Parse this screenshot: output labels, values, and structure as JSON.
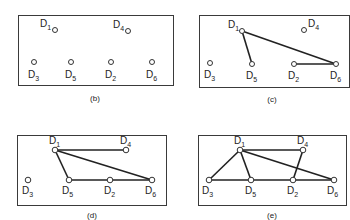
{
  "figure": {
    "panels": [
      {
        "id": "b",
        "caption": "(b)",
        "box": {
          "x": 18,
          "y": 15,
          "w": 155,
          "h": 70
        },
        "caption_pos": {
          "x": 95,
          "y": 101
        },
        "node_radius": 2.5,
        "nodes": [
          {
            "name": "D1",
            "base": "D",
            "sub": "1",
            "x": 55,
            "y": 30,
            "lx": 40,
            "ly": 27
          },
          {
            "name": "D4",
            "base": "D",
            "sub": "4",
            "x": 128,
            "y": 31,
            "lx": 113,
            "ly": 28
          },
          {
            "name": "D3",
            "base": "D",
            "sub": "3",
            "x": 34,
            "y": 62,
            "lx": 28,
            "ly": 78
          },
          {
            "name": "D5",
            "base": "D",
            "sub": "5",
            "x": 71,
            "y": 62,
            "lx": 65,
            "ly": 78
          },
          {
            "name": "D2",
            "base": "D",
            "sub": "2",
            "x": 111,
            "y": 62,
            "lx": 105,
            "ly": 78
          },
          {
            "name": "D6",
            "base": "D",
            "sub": "6",
            "x": 152,
            "y": 62,
            "lx": 146,
            "ly": 78
          }
        ],
        "edges": []
      },
      {
        "id": "c",
        "caption": "(c)",
        "box": {
          "x": 199,
          "y": 15,
          "w": 150,
          "h": 72
        },
        "caption_pos": {
          "x": 272,
          "y": 102
        },
        "node_radius": 2.5,
        "nodes": [
          {
            "name": "D1",
            "base": "D",
            "sub": "1",
            "x": 242,
            "y": 31,
            "lx": 228,
            "ly": 28
          },
          {
            "name": "D4",
            "base": "D",
            "sub": "4",
            "x": 304,
            "y": 30,
            "lx": 308,
            "ly": 27
          },
          {
            "name": "D3",
            "base": "D",
            "sub": "3",
            "x": 210,
            "y": 63,
            "lx": 204,
            "ly": 78
          },
          {
            "name": "D5",
            "base": "D",
            "sub": "5",
            "x": 252,
            "y": 64,
            "lx": 246,
            "ly": 79
          },
          {
            "name": "D2",
            "base": "D",
            "sub": "2",
            "x": 294,
            "y": 64,
            "lx": 288,
            "ly": 79
          },
          {
            "name": "D6",
            "base": "D",
            "sub": "6",
            "x": 336,
            "y": 64,
            "lx": 330,
            "ly": 79
          }
        ],
        "edges": [
          [
            "D1",
            "D5"
          ],
          [
            "D1",
            "D6"
          ],
          [
            "D2",
            "D6"
          ]
        ]
      },
      {
        "id": "d",
        "caption": "(d)",
        "box": {
          "x": 17,
          "y": 135,
          "w": 149,
          "h": 70
        },
        "caption_pos": {
          "x": 92,
          "y": 218
        },
        "node_radius": 2.8,
        "nodes": [
          {
            "name": "D1",
            "base": "D",
            "sub": "1",
            "x": 55,
            "y": 150,
            "lx": 49,
            "ly": 144
          },
          {
            "name": "D4",
            "base": "D",
            "sub": "4",
            "x": 126,
            "y": 150,
            "lx": 120,
            "ly": 144
          },
          {
            "name": "D3",
            "base": "D",
            "sub": "3",
            "x": 28,
            "y": 180,
            "lx": 22,
            "ly": 194
          },
          {
            "name": "D5",
            "base": "D",
            "sub": "5",
            "x": 69,
            "y": 180,
            "lx": 62,
            "ly": 194
          },
          {
            "name": "D2",
            "base": "D",
            "sub": "2",
            "x": 110,
            "y": 180,
            "lx": 104,
            "ly": 194
          },
          {
            "name": "D6",
            "base": "D",
            "sub": "6",
            "x": 152,
            "y": 180,
            "lx": 145,
            "ly": 194
          }
        ],
        "edges": [
          [
            "D1",
            "D4"
          ],
          [
            "D1",
            "D5"
          ],
          [
            "D1",
            "D6"
          ],
          [
            "D5",
            "D2"
          ],
          [
            "D2",
            "D6"
          ]
        ]
      },
      {
        "id": "e",
        "caption": "(e)",
        "box": {
          "x": 198,
          "y": 135,
          "w": 148,
          "h": 70
        },
        "caption_pos": {
          "x": 272,
          "y": 218
        },
        "node_radius": 2.8,
        "nodes": [
          {
            "name": "D1",
            "base": "D",
            "sub": "1",
            "x": 240,
            "y": 150,
            "lx": 234,
            "ly": 144
          },
          {
            "name": "D4",
            "base": "D",
            "sub": "4",
            "x": 303,
            "y": 150,
            "lx": 297,
            "ly": 144
          },
          {
            "name": "D3",
            "base": "D",
            "sub": "3",
            "x": 209,
            "y": 180,
            "lx": 202,
            "ly": 194
          },
          {
            "name": "D5",
            "base": "D",
            "sub": "5",
            "x": 251,
            "y": 180,
            "lx": 245,
            "ly": 194
          },
          {
            "name": "D2",
            "base": "D",
            "sub": "2",
            "x": 293,
            "y": 180,
            "lx": 287,
            "ly": 194
          },
          {
            "name": "D6",
            "base": "D",
            "sub": "6",
            "x": 334,
            "y": 180,
            "lx": 327,
            "ly": 194
          }
        ],
        "edges": [
          [
            "D1",
            "D4"
          ],
          [
            "D1",
            "D3"
          ],
          [
            "D1",
            "D5"
          ],
          [
            "D1",
            "D6"
          ],
          [
            "D4",
            "D2"
          ],
          [
            "D3",
            "D5"
          ],
          [
            "D5",
            "D2"
          ],
          [
            "D2",
            "D6"
          ]
        ]
      }
    ]
  }
}
